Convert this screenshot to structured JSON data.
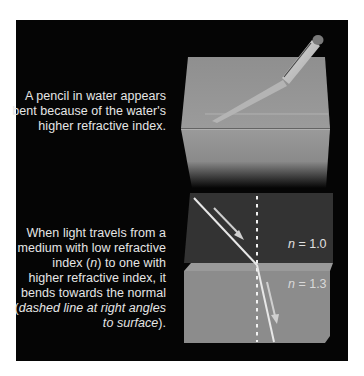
{
  "figure": {
    "panel_top": {
      "caption_lines": [
        "A pencil in water appears",
        "bent because of the water's",
        "higher refractive index."
      ]
    },
    "panel_bottom": {
      "caption_lines": [
        "When light travels from a",
        "medium with low refractive",
        "index (",
        "n",
        ") to one with",
        "higher refractive index, it",
        "bends towards the normal",
        "(",
        "dashed line at right angles",
        "to surface",
        ")."
      ],
      "label_air_n": "n",
      "label_air_value": " = 1.0",
      "label_water_n": "n",
      "label_water_value": " = 1.3"
    },
    "colors": {
      "background": "#050505",
      "text": "#e6e6e6",
      "air_medium": "#333333",
      "water_medium": "#8c8c8c",
      "ray": "#e8e8e8"
    }
  }
}
